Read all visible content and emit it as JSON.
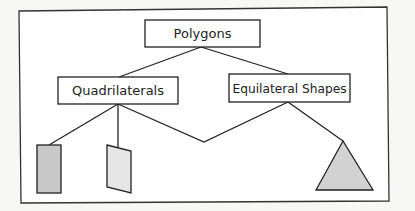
{
  "diagram": {
    "root": {
      "label": "Polygons"
    },
    "children": [
      {
        "label": "Quadrilaterals"
      },
      {
        "label": "Equilateral Shapes"
      }
    ],
    "shapes": [
      {
        "name": "rectangle",
        "fill": "#c8c8c8"
      },
      {
        "name": "parallelogram",
        "fill": "#e6e6e6"
      },
      {
        "name": "triangle",
        "fill": "#d2d2d2"
      }
    ],
    "colors": {
      "stroke": "#222222",
      "background": "#ffffff"
    }
  }
}
